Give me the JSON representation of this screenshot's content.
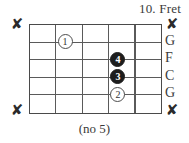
{
  "diagram": {
    "type": "guitar-chord-diagram",
    "title": "10. Fret",
    "caption": "(no 5)",
    "grid": {
      "fret_columns": 5,
      "string_rows": 5,
      "string_lines": 6,
      "fret_lines": 6
    },
    "colors": {
      "line": "#5a5a5a",
      "border": "#4a4a4a",
      "text": "#3a3a3a",
      "dot_filled": "#1d1d1d",
      "dot_open_border": "#4d4d4d",
      "background": "#ffffff"
    },
    "mute_markers": [
      {
        "name": "x-left-top",
        "label": "✘",
        "side": "left",
        "string": 1
      },
      {
        "name": "x-left-bottom",
        "label": "✘",
        "side": "left",
        "string": 6
      },
      {
        "name": "x-right-top",
        "label": "✘",
        "side": "right",
        "string": 1
      },
      {
        "name": "x-right-bottom",
        "label": "✘",
        "side": "right",
        "string": 6
      }
    ],
    "string_labels": [
      {
        "label": "G",
        "string": 2
      },
      {
        "label": "F",
        "string": 3
      },
      {
        "label": "C",
        "string": 4
      },
      {
        "label": "G",
        "string": 5
      }
    ],
    "finger_dots": [
      {
        "finger": "1",
        "fret": 2,
        "string": 2,
        "style": "open"
      },
      {
        "finger": "4",
        "fret": 4,
        "string": 3,
        "style": "filled"
      },
      {
        "finger": "3",
        "fret": 4,
        "string": 4,
        "style": "filled"
      },
      {
        "finger": "2",
        "fret": 4,
        "string": 5,
        "style": "open"
      }
    ]
  }
}
